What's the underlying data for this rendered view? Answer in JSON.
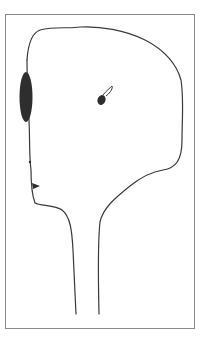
{
  "figure": {
    "colors": {
      "background": "#ffffff",
      "frame": "#8a8a8a",
      "outline": "#3a3a3a",
      "fill": "#2e2e2e"
    },
    "elements": [
      {
        "name": "frame",
        "shape": "rectangle"
      },
      {
        "name": "head-outline",
        "shape": "freeform-line"
      },
      {
        "name": "left-dark-ellipse",
        "shape": "filled-ellipse"
      },
      {
        "name": "ear-mark",
        "shape": "filled-teardrop-with-loop"
      },
      {
        "name": "nose-mark",
        "shape": "filled-triangle"
      },
      {
        "name": "small-dot",
        "shape": "dot"
      }
    ]
  }
}
